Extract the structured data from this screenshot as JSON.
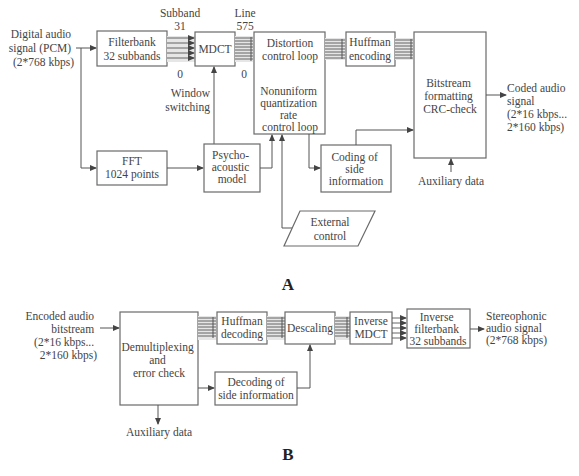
{
  "diagram_a": {
    "label": "A",
    "input": [
      "Digital audio",
      "signal (PCM)",
      "(2*768 kbps)"
    ],
    "filterbank": [
      "Filterbank",
      "32 subbands"
    ],
    "subband_top": [
      "Subband",
      "31"
    ],
    "subband_bottom": "0",
    "mdct": "MDCT",
    "line_top": [
      "Line",
      "575"
    ],
    "line_bottom": "0",
    "window_switching": [
      "Window",
      "switching"
    ],
    "distortion": [
      "Distortion",
      "control loop"
    ],
    "nonuniform": [
      "Nonuniform",
      "quantization",
      "rate",
      "control loop"
    ],
    "huffman": [
      "Huffman",
      "encoding"
    ],
    "bitstream": [
      "Bitstream",
      "formatting",
      "CRC-check"
    ],
    "output": [
      "Coded audio",
      "signal",
      "(2*16 kbps...",
      "2*160 kbps)"
    ],
    "fft": [
      "FFT",
      "1024 points"
    ],
    "psycho": [
      "Psycho-",
      "acoustic",
      "model"
    ],
    "coding_side": [
      "Coding of",
      "side",
      "information"
    ],
    "external": [
      "External",
      "control"
    ],
    "aux": "Auxiliary data"
  },
  "diagram_b": {
    "label": "B",
    "input": [
      "Encoded audio",
      "bitstream",
      "(2*16 kbps...",
      "2*160 kbps)"
    ],
    "demux": [
      "Demultiplexing",
      "and",
      "error check"
    ],
    "huffman": [
      "Huffman",
      "decoding"
    ],
    "descaling": "Descaling",
    "inv_mdct": [
      "Inverse",
      "MDCT"
    ],
    "inv_filterbank": [
      "Inverse",
      "filterbank",
      "32 subbands"
    ],
    "output": [
      "Stereophonic",
      "audio signal",
      "(2*768 kbps)"
    ],
    "decoding_side": [
      "Decoding of",
      "side information"
    ],
    "aux": "Auxiliary data"
  }
}
